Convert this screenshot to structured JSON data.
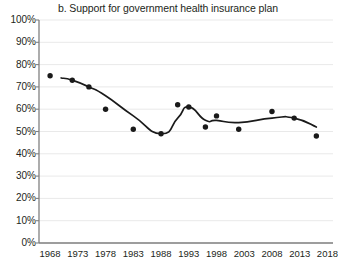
{
  "chart_data": {
    "type": "scatter",
    "title": "b. Support for government health insurance plan",
    "xlabel": "",
    "ylabel": "",
    "xlim": [
      1966,
      2019
    ],
    "ylim": [
      0,
      100
    ],
    "grid": true,
    "legend": false,
    "y_tick_labels": [
      "100%",
      "90%",
      "80%",
      "70%",
      "60%",
      "50%",
      "40%",
      "30%",
      "20%",
      "10%",
      "0%"
    ],
    "y_tick_values": [
      100,
      90,
      80,
      70,
      60,
      50,
      40,
      30,
      20,
      10,
      0
    ],
    "x_tick_labels": [
      "1968",
      "1973",
      "1978",
      "1983",
      "1988",
      "1993",
      "1998",
      "2003",
      "2008",
      "2013",
      "2018"
    ],
    "x_tick_values": [
      1968,
      1973,
      1978,
      1983,
      1988,
      1993,
      1998,
      2003,
      2008,
      2013,
      2018
    ],
    "series": [
      {
        "name": "Support for government health insurance plan",
        "kind": "scatter",
        "marker": "circle",
        "color": "#1a1a1a",
        "x": [
          1968,
          1972,
          1975,
          1978,
          1983,
          1988,
          1991,
          1993,
          1996,
          1998,
          2002,
          2008,
          2012,
          2016
        ],
        "values": [
          75,
          73,
          70,
          60,
          51,
          49,
          62,
          61,
          52,
          57,
          51,
          59,
          56,
          48
        ]
      },
      {
        "name": "Smoothed trend",
        "kind": "line",
        "color": "#1a1a1a",
        "x": [
          1970,
          1972,
          1975,
          1978,
          1983,
          1988,
          1991,
          1993,
          1996,
          1998,
          2002,
          2008,
          2012,
          2016
        ],
        "values": [
          74,
          73,
          70,
          66,
          57,
          49,
          56,
          61,
          55,
          55,
          54,
          56,
          56,
          52
        ]
      }
    ]
  }
}
